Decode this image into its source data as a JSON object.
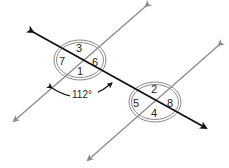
{
  "diagram": {
    "type": "parallel-lines-cut-by-transversal",
    "colors": {
      "transversal": "#111111",
      "parallel_lines": "#8a8a8a",
      "ellipse": "#8a8a8a",
      "text": "#222222"
    },
    "intersection_1": {
      "angles": [
        {
          "position": "top",
          "label": "3"
        },
        {
          "position": "left",
          "label": "7"
        },
        {
          "position": "right",
          "label": "6"
        },
        {
          "position": "bottom",
          "label": "1"
        }
      ]
    },
    "intersection_2": {
      "angles": [
        {
          "position": "top",
          "label": "2"
        },
        {
          "position": "left",
          "label": "5"
        },
        {
          "position": "right",
          "label": "8"
        },
        {
          "position": "bottom",
          "label": "4"
        }
      ]
    },
    "angle_measure": {
      "label": "112°"
    }
  }
}
